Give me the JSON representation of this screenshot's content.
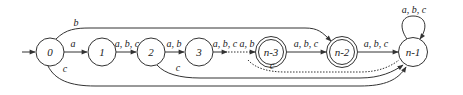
{
  "diagram": {
    "type": "finite-automaton",
    "colors": {
      "stroke": "#333333",
      "text": "#222222",
      "background": "#ffffff"
    },
    "start_state": "0",
    "nodes": [
      {
        "id": "0",
        "label": "0",
        "x": 50,
        "y": 52,
        "accepting": false
      },
      {
        "id": "1",
        "label": "1",
        "x": 102,
        "y": 52,
        "accepting": false
      },
      {
        "id": "2",
        "label": "2",
        "x": 151,
        "y": 52,
        "accepting": false
      },
      {
        "id": "3",
        "label": "3",
        "x": 199,
        "y": 52,
        "accepting": false
      },
      {
        "id": "n-3",
        "label": "n-3",
        "x": 271,
        "y": 52,
        "accepting": true
      },
      {
        "id": "n-2",
        "label": "n-2",
        "x": 342,
        "y": 52,
        "accepting": true
      },
      {
        "id": "n-1",
        "label": "n-1",
        "x": 413,
        "y": 52,
        "accepting": false
      }
    ],
    "edges": [
      {
        "from": "0",
        "to": "1",
        "label": "a"
      },
      {
        "from": "1",
        "to": "2",
        "label": "a, b, c"
      },
      {
        "from": "2",
        "to": "3",
        "label": "a, b"
      },
      {
        "from": "3",
        "to": "...",
        "label": "a, b, c",
        "dotted_continuation": true
      },
      {
        "from": "...",
        "to": "n-3",
        "label": "a, b"
      },
      {
        "from": "n-3",
        "to": "n-2",
        "label": "a, b, c"
      },
      {
        "from": "n-2",
        "to": "n-1",
        "label": "a, b, c"
      },
      {
        "from": "0",
        "to": "n-2",
        "label": "b"
      },
      {
        "from": "0",
        "to": "n-1",
        "label": "c"
      },
      {
        "from": "2",
        "to": "n-1",
        "label": "c"
      },
      {
        "from": "...",
        "to": "n-1",
        "label": "c",
        "dotted": true
      },
      {
        "from": "n-1",
        "to": "n-1",
        "label": "a, b, c",
        "self_loop": true
      }
    ]
  }
}
